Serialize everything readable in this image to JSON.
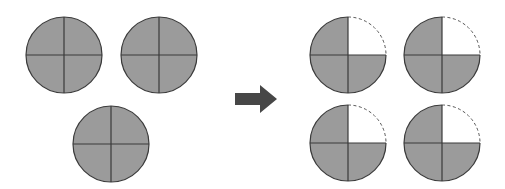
{
  "diagram": {
    "colors": {
      "fill": "#9b9b9b",
      "stroke": "#3a3a3a",
      "empty": "#ffffff",
      "dashed": "#555555",
      "arrow": "#474747"
    },
    "before": {
      "label": "3 wholes",
      "circles": [
        {
          "parts": 4,
          "shaded_parts": 4
        },
        {
          "parts": 4,
          "shaded_parts": 4
        },
        {
          "parts": 4,
          "shaded_parts": 4
        }
      ]
    },
    "arrow": {
      "direction": "right"
    },
    "after": {
      "label": "4 × 3/4",
      "circles": [
        {
          "parts": 4,
          "shaded_parts": 3,
          "missing_quadrant": "top-right"
        },
        {
          "parts": 4,
          "shaded_parts": 3,
          "missing_quadrant": "top-right"
        },
        {
          "parts": 4,
          "shaded_parts": 3,
          "missing_quadrant": "top-right"
        },
        {
          "parts": 4,
          "shaded_parts": 3,
          "missing_quadrant": "top-right"
        }
      ]
    }
  }
}
